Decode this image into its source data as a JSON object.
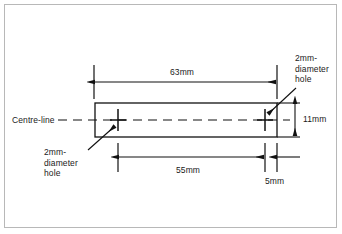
{
  "drawing": {
    "title": "Engineering dimension drawing of a flat bar with two holes",
    "colors": {
      "line": "#111111",
      "frame": "#b8b8b8",
      "background": "#ffffff",
      "text": "#1a1a1a"
    },
    "centre_line_label": "Centre-line",
    "dimensions": [
      {
        "name": "overall-length",
        "value": "63mm"
      },
      {
        "name": "hole-spacing",
        "value": "55mm"
      },
      {
        "name": "edge-distance",
        "value": "5mm"
      },
      {
        "name": "bar-height",
        "value": "11mm"
      }
    ],
    "annotations": [
      {
        "name": "hole-callout-top-right",
        "lines": [
          "2mm-",
          "diameter",
          "hole"
        ]
      },
      {
        "name": "hole-callout-bottom-left",
        "lines": [
          "2mm-",
          "diameter",
          "hole"
        ]
      }
    ]
  }
}
